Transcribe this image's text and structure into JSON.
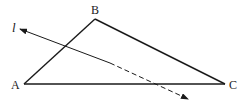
{
  "diagram": {
    "type": "geometry",
    "points": {
      "A": {
        "label": "A",
        "x": 24,
        "y": 84
      },
      "B": {
        "label": "B",
        "x": 95,
        "y": 19
      },
      "C": {
        "label": "C",
        "x": 225,
        "y": 84
      }
    },
    "segments": [
      {
        "from": "A",
        "to": "B",
        "style": "solid"
      },
      {
        "from": "B",
        "to": "C",
        "style": "solid"
      },
      {
        "from": "A",
        "to": "C",
        "style": "solid"
      }
    ],
    "line_l": {
      "label": "l",
      "start": {
        "x": 20,
        "y": 29
      },
      "solid_end": {
        "x": 110,
        "y": 63
      },
      "end": {
        "x": 188,
        "y": 99
      },
      "solid_part": "outside-to-inside triangle",
      "dashed_part": "below AB crossing AC",
      "arrows": "both ends"
    },
    "colors": {
      "stroke": "#1a1a1a",
      "background": "#ffffff"
    }
  }
}
